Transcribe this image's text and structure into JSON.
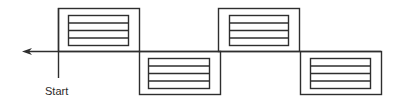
{
  "diagram": {
    "start_label": "Start",
    "stroke_color": "#2e2e2e",
    "baseline_y": 51,
    "arrow": {
      "x_tip": 22,
      "x_end": 381,
      "y": 51,
      "direction": "left"
    },
    "start_line": {
      "x": 58,
      "y1": 8,
      "y2": 78
    },
    "modules": [
      {
        "id": 1,
        "position": "above",
        "outer": {
          "x": 58,
          "y": 8,
          "w": 81,
          "h": 43
        },
        "inner": {
          "x": 68,
          "y": 15,
          "w": 60,
          "h": 30
        },
        "sections": 4
      },
      {
        "id": 2,
        "position": "below",
        "outer": {
          "x": 139,
          "y": 51,
          "w": 81,
          "h": 43
        },
        "inner": {
          "x": 148,
          "y": 58,
          "w": 61,
          "h": 30
        },
        "sections": 4
      },
      {
        "id": 3,
        "position": "above",
        "outer": {
          "x": 218,
          "y": 8,
          "w": 81,
          "h": 43
        },
        "inner": {
          "x": 229,
          "y": 15,
          "w": 59,
          "h": 30
        },
        "sections": 4
      },
      {
        "id": 4,
        "position": "below",
        "outer": {
          "x": 300,
          "y": 51,
          "w": 81,
          "h": 43
        },
        "inner": {
          "x": 310,
          "y": 58,
          "w": 60,
          "h": 30
        },
        "sections": 4
      }
    ]
  }
}
